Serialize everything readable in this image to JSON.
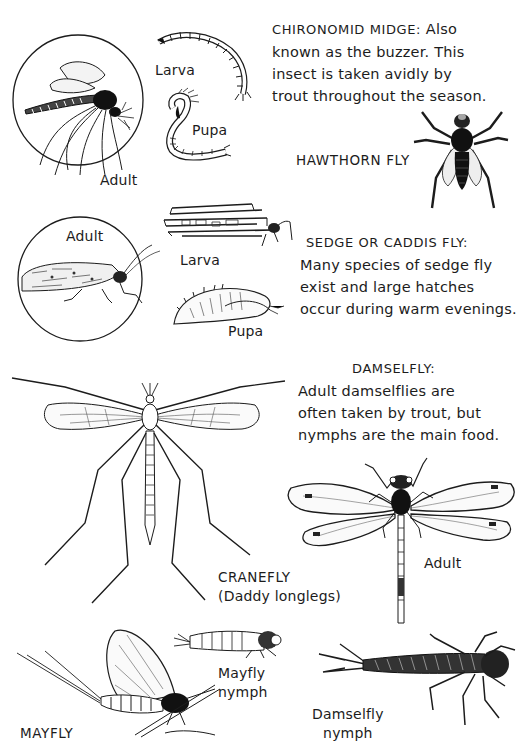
{
  "page": {
    "background": "#ffffff",
    "ink_color": "#1c1c1c"
  },
  "chironomid": {
    "title": "CHIRONOMID MIDGE:",
    "lines": [
      "Also",
      "known as the buzzer. This",
      "insect is taken avidly by",
      "trout throughout the season."
    ],
    "labels": {
      "adult": "Adult",
      "larva": "Larva",
      "pupa": "Pupa"
    }
  },
  "hawthorn": {
    "title": "HAWTHORN FLY"
  },
  "sedge": {
    "title": "SEDGE OR CADDIS FLY:",
    "lines": [
      "Many species of sedge fly",
      "exist and large hatches",
      "occur during warm evenings."
    ],
    "labels": {
      "adult": "Adult",
      "larva": "Larva",
      "pupa": "Pupa"
    }
  },
  "damselfly": {
    "title": "DAMSELFLY:",
    "lines": [
      "Adult damselflies are",
      "often taken by trout, but",
      "nymphs are the main food."
    ],
    "labels": {
      "adult": "Adult",
      "nymph_line1": "Damselfly",
      "nymph_line2": "nymph"
    }
  },
  "cranefly": {
    "title": "CRANEFLY",
    "subtitle": "(Daddy longlegs)"
  },
  "mayfly": {
    "title": "MAYFLY",
    "labels": {
      "nymph_line1": "Mayfly",
      "nymph_line2": "nymph"
    }
  }
}
